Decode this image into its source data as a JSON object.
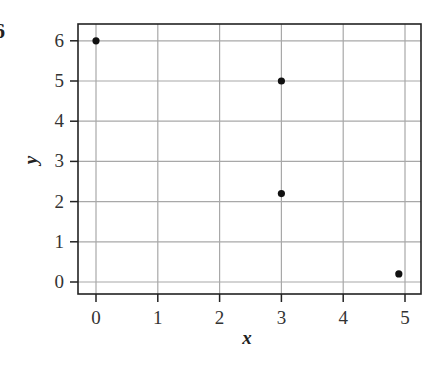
{
  "problem_number": "6",
  "chart_data": {
    "type": "scatter",
    "title": "",
    "xlabel": "x",
    "ylabel": "y",
    "xlim": [
      -0.3,
      5.25
    ],
    "ylim": [
      -0.3,
      6.4
    ],
    "xticks": [
      0,
      1,
      2,
      3,
      4,
      5
    ],
    "yticks": [
      0,
      1,
      2,
      3,
      4,
      5,
      6
    ],
    "grid": true,
    "legend": null,
    "points": [
      {
        "x": 0,
        "y": 6
      },
      {
        "x": 3,
        "y": 5
      },
      {
        "x": 3,
        "y": 2.2
      },
      {
        "x": 4.9,
        "y": 0.2
      }
    ],
    "colors": {
      "point": "#111111",
      "grid": "#a8a8a8",
      "frame": "#222222"
    }
  }
}
